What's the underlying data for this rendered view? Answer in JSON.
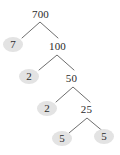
{
  "diagram": {
    "root_value": "700",
    "background_color": "#ffffff",
    "text_color": "#2b2b2b",
    "branch_color": "#6e6e6e",
    "prime_highlight_color": "#e3e3e3",
    "nodes": [
      {
        "id": "n700",
        "label": "700",
        "kind": "composite",
        "x": 28,
        "y": 7,
        "w": 25,
        "h": 14
      },
      {
        "id": "n7",
        "label": "7",
        "kind": "prime",
        "x": 3,
        "y": 37,
        "w": 20,
        "h": 15
      },
      {
        "id": "n100",
        "label": "100",
        "kind": "composite",
        "x": 45,
        "y": 39,
        "w": 25,
        "h": 14
      },
      {
        "id": "n2a",
        "label": "2",
        "kind": "prime",
        "x": 19,
        "y": 69,
        "w": 20,
        "h": 15
      },
      {
        "id": "n50",
        "label": "50",
        "kind": "composite",
        "x": 62,
        "y": 71,
        "w": 19,
        "h": 14
      },
      {
        "id": "n2b",
        "label": "2",
        "kind": "prime",
        "x": 37,
        "y": 101,
        "w": 20,
        "h": 15
      },
      {
        "id": "n25",
        "label": "25",
        "kind": "composite",
        "x": 77,
        "y": 102,
        "w": 19,
        "h": 14
      },
      {
        "id": "n5a",
        "label": "5",
        "kind": "prime",
        "x": 52,
        "y": 131,
        "w": 20,
        "h": 15
      },
      {
        "id": "n5b",
        "label": "5",
        "kind": "prime",
        "x": 94,
        "y": 129,
        "w": 20,
        "h": 15
      }
    ],
    "branches": [
      {
        "id": "b1",
        "from": "n700",
        "apex_x": 40,
        "apex_y": 22,
        "left_x": 22,
        "left_y": 38,
        "right_x": 58,
        "right_y": 38
      },
      {
        "id": "b2",
        "from": "n100",
        "apex_x": 57,
        "apex_y": 55,
        "left_x": 39,
        "left_y": 70,
        "right_x": 74,
        "right_y": 70
      },
      {
        "id": "b3",
        "from": "n50",
        "apex_x": 73,
        "apex_y": 87,
        "left_x": 56,
        "left_y": 102,
        "right_x": 90,
        "right_y": 102
      },
      {
        "id": "b4",
        "from": "n25",
        "apex_x": 87,
        "apex_y": 118,
        "left_x": 69,
        "left_y": 133,
        "right_x": 105,
        "right_y": 133
      }
    ]
  },
  "chart_data": {
    "type": "diagram",
    "root": 700,
    "factorization": [
      7,
      2,
      2,
      5,
      5
    ],
    "levels": [
      {
        "level": 0,
        "values": [
          "700"
        ]
      },
      {
        "level": 1,
        "values": [
          "7",
          "100"
        ]
      },
      {
        "level": 2,
        "values": [
          "2",
          "50"
        ]
      },
      {
        "level": 3,
        "values": [
          "2",
          "25"
        ]
      },
      {
        "level": 4,
        "values": [
          "5",
          "5"
        ]
      }
    ],
    "edges": [
      {
        "parent": "700",
        "children": [
          "7",
          "100"
        ]
      },
      {
        "parent": "100",
        "children": [
          "2",
          "50"
        ]
      },
      {
        "parent": "50",
        "children": [
          "2",
          "25"
        ]
      },
      {
        "parent": "25",
        "children": [
          "5",
          "5"
        ]
      }
    ]
  }
}
